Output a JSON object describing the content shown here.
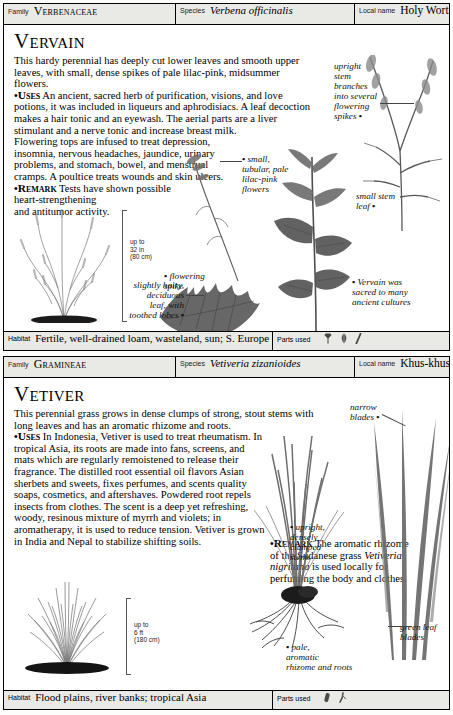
{
  "entries": [
    {
      "header": {
        "family_key": "Family",
        "family_value": "Verbenaceae",
        "species_key": "Species",
        "species_value": "Verbena officinalis",
        "localname_key": "Local name",
        "localname_value": "Holy Wort"
      },
      "title": "Vervain",
      "intro": "This hardy perennial has deeply cut lower leaves and smooth upper leaves, with small, dense spikes of pale lilac-pink, midsummer flowers.",
      "uses_label": "Uses",
      "uses_text": " An ancient, sacred herb of purification, visions, and love potions, it was included in liqueurs and aphrodisiacs. A leaf decoction makes a hair tonic and an eyewash. The aerial parts are a liver stimulant and a nerve tonic and increase breast milk.",
      "uses_text_2": "Flowering tops are infused to treat depression, insomnia, nervous headaches, jaundice, urinary problems, and stomach, bowel, and menstrual cramps. A poultice treats wounds and skin ulcers.",
      "remark_label": "Remark",
      "remark_text": " Tests have shown possible",
      "remark_text_2": "heart-strengthening",
      "remark_text_3": "and antitumor activity.",
      "scale": {
        "prefix": "up to",
        "imperial": "32 in",
        "metric": "(80 cm)"
      },
      "annotations": [
        {
          "name": "upright-stem-annotation",
          "text": "upright\nstem\nbranches\ninto several\nflowering\nspikes •"
        },
        {
          "name": "flower-annotation",
          "text": "• small,\ntubular, pale\nlilac-pink\nflowers"
        },
        {
          "name": "small-stem-leaf-annotation",
          "text": "small stem\nleaf •"
        },
        {
          "name": "flowering-spike-annotation",
          "text": "• flowering\nspike"
        },
        {
          "name": "leaf-annotation",
          "text": "slightly hairy,\ndeciduous\nleaf, with\ntoothed lobes •"
        },
        {
          "name": "culture-annotation",
          "text": "• Vervain was\nsacred to many\nancient cultures"
        }
      ],
      "footer": {
        "habitat_key": "Habitat",
        "habitat_value": "Fertile, well-drained loam, wasteland, sun; S. Europe",
        "parts_key": "Parts used",
        "parts_icons": [
          "flower-icon",
          "leaf-icon",
          "stem-icon"
        ]
      }
    },
    {
      "header": {
        "family_key": "Family",
        "family_value": "Gramineae",
        "species_key": "Species",
        "species_value": "Vetiveria zizanioides",
        "localname_key": "Local name",
        "localname_value": "Khus-khus"
      },
      "title": "Vetiver",
      "intro": "This perennial grass grows in dense clumps of strong, stout stems with long leaves and has an aromatic rhizome and roots.",
      "uses_label": "Uses",
      "uses_text": " In Indonesia, Vetiver is used to treat rheumatism. In tropical Asia, its roots are made into fans, screens, and mats which are regularly remoistened to release their fragrance. The distilled root essential oil flavors Asian sherbets and sweets, fixes perfumes, and scents quality soaps, cosmetics, and aftershaves. Powdered root repels insects from clothes. The scent is a deep yet refreshing, woody, resinous mixture of myrrh and violets; in aromatherapy, it is used to reduce tension. Vetiver is grown in India and Nepal to stabilize shifting soils.",
      "remark_label": "Remark",
      "remark_text": " The aromatic rhizome of the Sudanese grass ",
      "remark_italic": "Vetiveria nigritana",
      "remark_text_after": " is used locally for perfuming the body and clothes.",
      "scale": {
        "prefix": "up to",
        "imperial": "6 ft",
        "metric": "(180 cm)"
      },
      "annotations": [
        {
          "name": "narrow-blades-annotation",
          "text": "narrow\nblades •"
        },
        {
          "name": "clumped-stems-annotation",
          "text": "• upright,\ndensely\nclumped\nstems"
        },
        {
          "name": "green-leaf-blades-annotation",
          "text": "green leaf\nblades"
        },
        {
          "name": "rhizome-annotation",
          "text": "• pale,\naromatic\nrhizome and roots"
        }
      ],
      "footer": {
        "habitat_key": "Habitat",
        "habitat_value": "Flood plains, river banks; tropical Asia",
        "parts_key": "Parts used",
        "parts_icons": [
          "rhizome-icon",
          "root-icon"
        ]
      }
    }
  ],
  "colors": {
    "header_fill": "#e9e9e6",
    "rule": "#000000",
    "illustration_ink": "#4a4a4a",
    "page_background": "#ffffff"
  }
}
